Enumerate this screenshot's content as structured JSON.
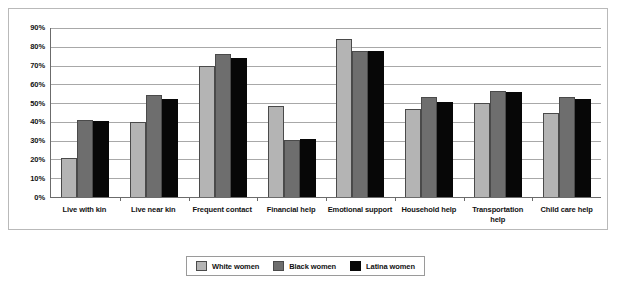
{
  "chart_data": {
    "type": "bar",
    "title": "",
    "subtitle": "",
    "xlabel": "",
    "ylabel": "",
    "ylim": [
      0,
      90
    ],
    "y_ticks": [
      "0%",
      "10%",
      "20%",
      "30%",
      "40%",
      "50%",
      "60%",
      "70%",
      "80%",
      "90%"
    ],
    "y_tick_values": [
      0,
      10,
      20,
      30,
      40,
      50,
      60,
      70,
      80,
      90
    ],
    "grid": true,
    "legend_position": "bottom-center",
    "categories": [
      "Live with kin",
      "Live near kin",
      "Frequent contact",
      "Financial help",
      "Emotional support",
      "Household help",
      "Transportation help",
      "Child care help"
    ],
    "series": [
      {
        "name": "White women",
        "color": "#b4b4b4",
        "values": [
          21,
          40,
          70,
          48.5,
          84,
          47,
          50,
          45
        ]
      },
      {
        "name": "Black women",
        "color": "#6e6e6e",
        "values": [
          41,
          54.5,
          76,
          30.5,
          78,
          53,
          56.5,
          53.5
        ]
      },
      {
        "name": "Latina women",
        "color": "#070707",
        "values": [
          40.5,
          52,
          74,
          31,
          78,
          50.5,
          56,
          52
        ]
      }
    ]
  },
  "legend": {
    "entries": [
      {
        "label": "White women",
        "swatch": "white-women"
      },
      {
        "label": "Black women",
        "swatch": "black-women"
      },
      {
        "label": "Latina women",
        "swatch": "latina-women"
      }
    ]
  }
}
